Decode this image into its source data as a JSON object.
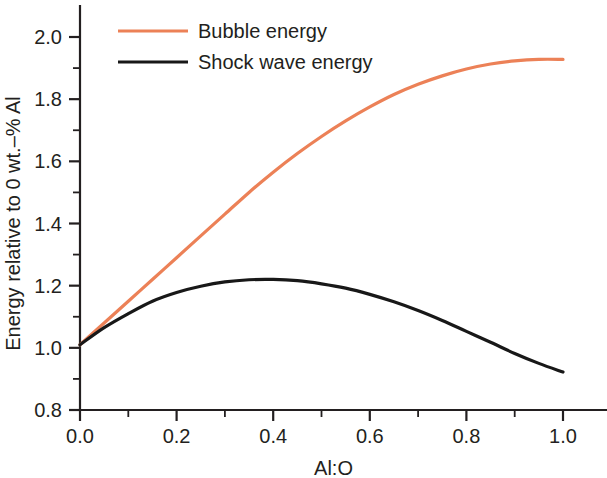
{
  "chart_data": {
    "type": "line",
    "title": "",
    "xlabel": "Al:O",
    "ylabel": "Energy relative to 0 wt.–% Al",
    "xlim": [
      0.0,
      1.0
    ],
    "ylim": [
      0.8,
      2.0
    ],
    "grid": false,
    "legend_position": "top-left",
    "xticks": [
      "0.0",
      "0.2",
      "0.4",
      "0.6",
      "0.8",
      "1.0"
    ],
    "xtick_values": [
      0.0,
      0.2,
      0.4,
      0.6,
      0.8,
      1.0
    ],
    "xminor_values": [
      0.1,
      0.3,
      0.5,
      0.7,
      0.9
    ],
    "yticks": [
      "0.8",
      "1.0",
      "1.2",
      "1.4",
      "1.6",
      "1.8",
      "2.0"
    ],
    "ytick_values": [
      0.8,
      1.0,
      1.2,
      1.4,
      1.6,
      1.8,
      2.0
    ],
    "yminor_values": [
      0.9,
      1.1,
      1.3,
      1.5,
      1.7,
      1.9
    ],
    "x": [
      0.0,
      0.05,
      0.1,
      0.15,
      0.2,
      0.25,
      0.3,
      0.35,
      0.4,
      0.45,
      0.5,
      0.55,
      0.6,
      0.65,
      0.7,
      0.75,
      0.8,
      0.85,
      0.9,
      0.95,
      1.0
    ],
    "series": [
      {
        "name": "Bubble energy",
        "color": "#ec8157",
        "values": [
          1.01,
          1.08,
          1.15,
          1.22,
          1.29,
          1.36,
          1.43,
          1.5,
          1.565,
          1.625,
          1.68,
          1.73,
          1.775,
          1.815,
          1.848,
          1.875,
          1.897,
          1.913,
          1.923,
          1.928,
          1.928
        ]
      },
      {
        "name": "Shock wave energy",
        "color": "#181818",
        "values": [
          1.01,
          1.065,
          1.11,
          1.15,
          1.178,
          1.198,
          1.212,
          1.219,
          1.22,
          1.216,
          1.206,
          1.192,
          1.172,
          1.148,
          1.12,
          1.088,
          1.053,
          1.018,
          0.982,
          0.95,
          0.922
        ]
      }
    ]
  },
  "legend": {
    "items": [
      {
        "label": "Bubble energy",
        "color": "#ec8157"
      },
      {
        "label": "Shock wave energy",
        "color": "#181818"
      }
    ]
  }
}
